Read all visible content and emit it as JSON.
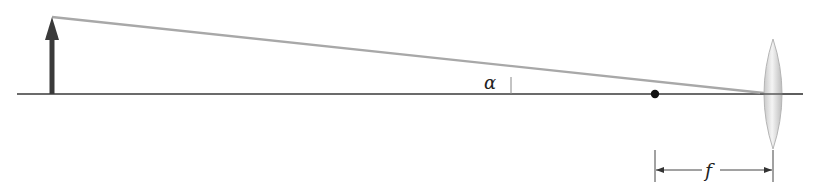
{
  "diagram": {
    "type": "optics-ray-diagram",
    "labels": {
      "angle": "α",
      "focal_length": "f"
    },
    "elements": {
      "object_arrow": {
        "x": 52,
        "y_base": 94,
        "y_tip": 17,
        "color": "#333333"
      },
      "optical_axis": {
        "x1": 17,
        "x2": 803,
        "y": 94,
        "color": "#333333"
      },
      "ray": {
        "x1": 52,
        "y1": 17,
        "x2": 773,
        "y2": 94,
        "color": "#a8a8a8"
      },
      "focal_point": {
        "x": 655,
        "y": 94,
        "color": "#111111"
      },
      "lens": {
        "cx": 773,
        "cy": 94,
        "rx": 12,
        "ry": 55,
        "color": "#d0d0d0"
      },
      "angle_marker": {
        "x": 511,
        "y_top": 77,
        "y_bottom": 94
      },
      "focal_dimension": {
        "x1": 655,
        "x2": 773,
        "y": 170
      }
    }
  }
}
